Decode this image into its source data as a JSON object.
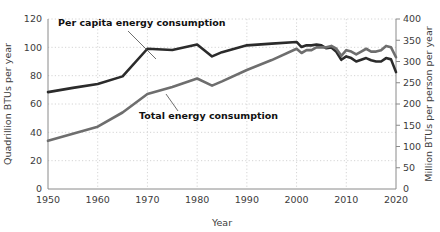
{
  "chart_data": {
    "type": "line",
    "title": "",
    "xlabel": "Year",
    "ylabel": "Quadrillion BTUs per year",
    "ylabel_right": "Million BTUs per person per year",
    "xlim": [
      1950,
      2020
    ],
    "ylim": [
      0,
      120
    ],
    "ylim_right": [
      0,
      400
    ],
    "grid": true,
    "legend_position": "inline-annotations",
    "xticks": [
      1950,
      1960,
      1970,
      1980,
      1990,
      2000,
      2010,
      2020
    ],
    "yticks_left": [
      0,
      20,
      40,
      60,
      80,
      100,
      120
    ],
    "yticks_right": [
      0,
      50,
      100,
      150,
      200,
      250,
      300,
      350,
      400
    ],
    "annotations": [
      {
        "text": "Per capita energy consumption",
        "series": "per_capita"
      },
      {
        "text": "Total energy consumption",
        "series": "total"
      }
    ],
    "series": [
      {
        "name": "Per capita energy consumption",
        "axis": "right",
        "units": "Million BTUs per person per year",
        "color": "#2b2b2b",
        "x": [
          1950,
          1955,
          1960,
          1965,
          1970,
          1975,
          1980,
          1983,
          1985,
          1990,
          1995,
          2000,
          2001,
          2002,
          2003,
          2004,
          2005,
          2006,
          2007,
          2008,
          2009,
          2010,
          2011,
          2012,
          2013,
          2014,
          2015,
          2016,
          2017,
          2018,
          2019,
          2020
        ],
        "values": [
          228,
          238,
          247,
          265,
          330,
          327,
          340,
          312,
          322,
          338,
          342,
          346,
          334,
          338,
          338,
          340,
          338,
          331,
          333,
          323,
          304,
          312,
          308,
          300,
          304,
          308,
          303,
          300,
          300,
          308,
          305,
          275
        ]
      },
      {
        "name": "Total energy consumption",
        "axis": "left",
        "units": "Quadrillion BTUs per year",
        "color": "#6e6e6e",
        "x": [
          1950,
          1955,
          1960,
          1965,
          1970,
          1975,
          1980,
          1983,
          1985,
          1990,
          1995,
          2000,
          2001,
          2002,
          2003,
          2004,
          2005,
          2006,
          2007,
          2008,
          2009,
          2010,
          2011,
          2012,
          2013,
          2014,
          2015,
          2016,
          2017,
          2018,
          2019,
          2020
        ],
        "values": [
          34,
          39,
          44,
          54,
          67,
          72,
          78,
          73,
          76,
          84,
          91,
          99,
          96,
          98,
          98,
          100,
          100,
          100,
          101,
          99,
          94,
          98,
          97,
          95,
          97,
          99,
          97,
          97,
          98,
          101,
          100,
          93
        ]
      }
    ]
  }
}
